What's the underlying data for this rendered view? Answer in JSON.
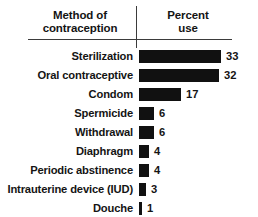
{
  "chart_data": {
    "type": "bar",
    "orientation": "horizontal",
    "title": "",
    "xlabel": "Percent use",
    "ylabel": "Method of contraception",
    "categories": [
      "Sterilization",
      "Oral contraceptive",
      "Condom",
      "Spermicide",
      "Withdrawal",
      "Diaphragm",
      "Periodic abstinence",
      "Intrauterine device (IUD)",
      "Douche"
    ],
    "values": [
      33,
      32,
      17,
      6,
      6,
      4,
      4,
      3,
      1
    ],
    "value_labels": [
      "33",
      "32",
      "17",
      "6",
      "6",
      "4",
      "4",
      "3",
      "1"
    ],
    "xlim": [
      0,
      33
    ],
    "grid": false,
    "legend": null,
    "bar_color": "#111111"
  },
  "header": {
    "method_line1": "Method of",
    "method_line2": "contraception",
    "percent_line1": "Percent",
    "percent_line2": "use"
  }
}
